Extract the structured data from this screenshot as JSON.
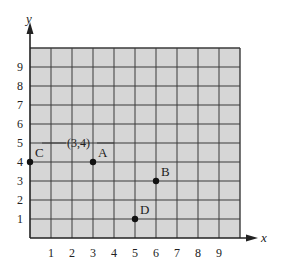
{
  "diagram": {
    "type": "coordinate-grid",
    "x_axis": {
      "label": "x",
      "ticks": [
        "1",
        "2",
        "3",
        "4",
        "5",
        "6",
        "7",
        "8",
        "9"
      ]
    },
    "y_axis": {
      "label": "y",
      "ticks": [
        "1",
        "2",
        "3",
        "4",
        "5",
        "6",
        "7",
        "8",
        "9"
      ]
    },
    "grid": {
      "cols": 10,
      "rows": 10,
      "fill": "#d6d6d6",
      "line_color": "#3a3a3a"
    },
    "points": [
      {
        "name": "A",
        "x": 3,
        "y": 4
      },
      {
        "name": "B",
        "x": 6,
        "y": 3
      },
      {
        "name": "C",
        "x": 0,
        "y": 4
      },
      {
        "name": "D",
        "x": 5,
        "y": 1
      }
    ],
    "annotation": {
      "text": "(3,4)",
      "target": "A"
    }
  },
  "chart_data": {
    "type": "scatter",
    "title": "",
    "xlabel": "x",
    "ylabel": "y",
    "xlim": [
      0,
      10
    ],
    "ylim": [
      0,
      10
    ],
    "grid": true,
    "series": [
      {
        "name": "points",
        "labels": [
          "A",
          "B",
          "C",
          "D"
        ],
        "x": [
          3,
          6,
          0,
          5
        ],
        "y": [
          4,
          3,
          4,
          1
        ]
      }
    ],
    "annotations": [
      {
        "text": "(3,4)",
        "x": 3,
        "y": 4
      }
    ]
  }
}
